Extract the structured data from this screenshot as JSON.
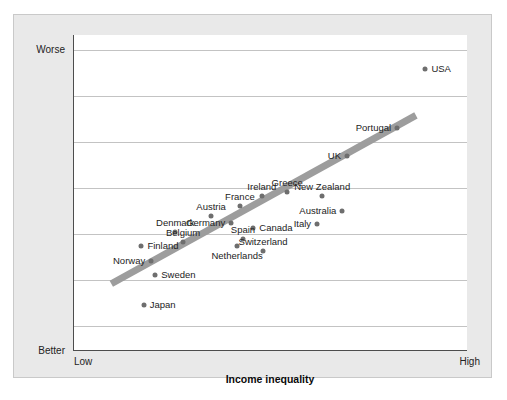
{
  "chart_data": {
    "type": "scatter",
    "title": "",
    "xlabel": "Income inequality",
    "ylabel": "Index of health and social problems",
    "x_tick_labels": [
      "Low",
      "High"
    ],
    "y_tick_labels": [
      "Worse",
      "Better"
    ],
    "y_axis_direction": "Better at bottom, Worse at top",
    "grid": "horizontal gridlines only",
    "gridline_count": 8,
    "legend": "none",
    "point_color": "#6e6e6e",
    "trendline": {
      "present": true,
      "color": "#9d9d9d",
      "description": "thick grey positive-slope regression line",
      "x_start_frac": 0.095,
      "y_start_frac": 0.79,
      "x_end_frac": 0.87,
      "y_end_frac": 0.255
    },
    "points": [
      {
        "label": "USA",
        "x_frac": 0.892,
        "y_frac": 0.107,
        "label_pos": "right"
      },
      {
        "label": "Portugal",
        "x_frac": 0.82,
        "y_frac": 0.294,
        "label_pos": "left"
      },
      {
        "label": "UK",
        "x_frac": 0.693,
        "y_frac": 0.383,
        "label_pos": "left"
      },
      {
        "label": "Greece",
        "x_frac": 0.541,
        "y_frac": 0.497,
        "label_pos": "above"
      },
      {
        "label": "New Zealand",
        "x_frac": 0.63,
        "y_frac": 0.51,
        "label_pos": "above"
      },
      {
        "label": "Ireland",
        "x_frac": 0.477,
        "y_frac": 0.509,
        "label_pos": "above"
      },
      {
        "label": "France",
        "x_frac": 0.421,
        "y_frac": 0.541,
        "label_pos": "above"
      },
      {
        "label": "Australia",
        "x_frac": 0.681,
        "y_frac": 0.557,
        "label_pos": "left"
      },
      {
        "label": "Austria",
        "x_frac": 0.348,
        "y_frac": 0.573,
        "label_pos": "above"
      },
      {
        "label": "Germany",
        "x_frac": 0.399,
        "y_frac": 0.595,
        "label_pos": "left"
      },
      {
        "label": "Italy",
        "x_frac": 0.617,
        "y_frac": 0.597,
        "label_pos": "left"
      },
      {
        "label": "Canada",
        "x_frac": 0.455,
        "y_frac": 0.611,
        "label_pos": "right"
      },
      {
        "label": "Denmark",
        "x_frac": 0.257,
        "y_frac": 0.623,
        "label_pos": "above"
      },
      {
        "label": "Spain",
        "x_frac": 0.429,
        "y_frac": 0.645,
        "label_pos": "above"
      },
      {
        "label": "Belgium",
        "x_frac": 0.277,
        "y_frac": 0.656,
        "label_pos": "above"
      },
      {
        "label": "Finland",
        "x_frac": 0.171,
        "y_frac": 0.668,
        "label_pos": "right"
      },
      {
        "label": "Netherlands",
        "x_frac": 0.414,
        "y_frac": 0.668,
        "label_pos": "below"
      },
      {
        "label": "Switzerland",
        "x_frac": 0.48,
        "y_frac": 0.683,
        "label_pos": "above"
      },
      {
        "label": "Norway",
        "x_frac": 0.196,
        "y_frac": 0.715,
        "label_pos": "left"
      },
      {
        "label": "Sweden",
        "x_frac": 0.206,
        "y_frac": 0.759,
        "label_pos": "right"
      },
      {
        "label": "Japan",
        "x_frac": 0.177,
        "y_frac": 0.854,
        "label_pos": "right"
      }
    ],
    "gridlines_y_frac": [
      0.048,
      0.194,
      0.34,
      0.479,
      0.484,
      0.63,
      0.776,
      0.92
    ]
  },
  "axes": {
    "y_top": "Worse",
    "y_bottom": "Better",
    "y_title": "Index of health and social problems",
    "x_low": "Low",
    "x_high": "High",
    "x_title": "Income inequality"
  }
}
